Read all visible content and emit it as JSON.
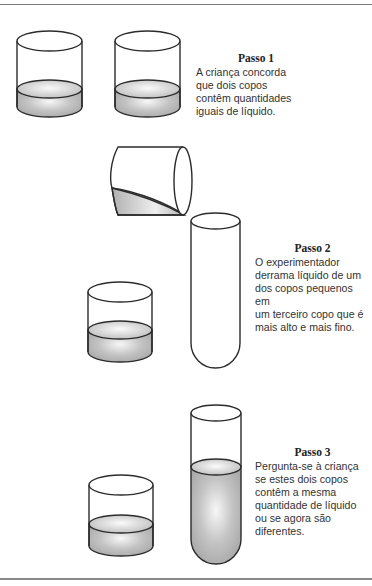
{
  "header": {
    "page_marker": ""
  },
  "steps": [
    {
      "title": "Passo 1",
      "description": "A criança concorda\nque dois copos\ncontêm quantidades\niguais de líquido."
    },
    {
      "title": "Passo 2",
      "description": "O experimentador\nderrama líquido de um\ndos copos pequenos em\num terceiro copo que é\nmais alto e mais fino."
    },
    {
      "title": "Passo 3",
      "description": "Pergunta-se à criança\nse estes dois copos\ncontêm a mesma\nquantidade de líquido\nou se agora são\ndiferentes."
    }
  ],
  "colors": {
    "outline": "#2b2b2b",
    "liquid": "#b9b9b9",
    "liquid_highlight": "#f4f4f4",
    "rule": "#7a7a7a"
  }
}
